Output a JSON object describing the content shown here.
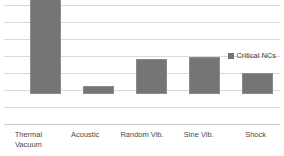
{
  "chart_data": {
    "type": "bar",
    "title": "",
    "subtitle": "",
    "xlabel": "",
    "ylabel": "",
    "categories": [
      "Thermal Vacuum",
      "Acoustic",
      "Random Vib.",
      "Sine Vib.",
      "Shock"
    ],
    "series": [
      {
        "name": "Critical NCs",
        "values": [
          96,
          7,
          29,
          31,
          18
        ],
        "color": "#757575"
      }
    ],
    "ylim": [
      0,
      100
    ],
    "gridlines": 8,
    "grid": true,
    "y_tick_labels": [],
    "x_tick_labels": [
      "Thermal Vacuum",
      "Acoustic",
      "Random Vib.",
      "Sine Vib.",
      "Shock"
    ],
    "legend": {
      "position": "right",
      "entries": [
        {
          "label": "Critical NCs",
          "color": "#757575",
          "marker": "square"
        }
      ]
    },
    "annotations": []
  },
  "legend": {
    "label": "Critical NCs"
  },
  "axis": {
    "categories": [
      {
        "line1": "Thermal",
        "line2": "Vacuum",
        "full": "Thermal Vacuum"
      },
      {
        "line1": "Acoustic",
        "line2": "",
        "full": "Acoustic"
      },
      {
        "line1": "Random Vib.",
        "line2": "",
        "full": "Random Vib."
      },
      {
        "line1": "Sine Vib.",
        "line2": "",
        "full": "Sine Vib."
      },
      {
        "line1": "Shock",
        "line2": "",
        "full": "Shock"
      }
    ]
  },
  "colors": {
    "bar": "#757575",
    "bar_border": "#8a8a8a",
    "gridline": "#d9d9d9",
    "baseline": "#c8c8c8",
    "label_text": "#4a4a4a",
    "legend_text": "#3f3f3f",
    "background": "#ffffff"
  }
}
